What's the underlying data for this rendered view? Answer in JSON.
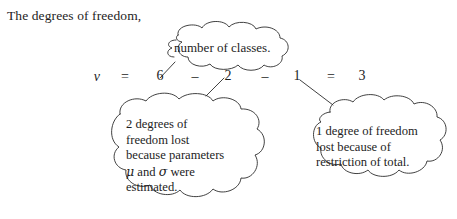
{
  "intro": {
    "text": "The degrees of freedom,"
  },
  "equation": {
    "nu_symbol": "ν",
    "equals_1": "=",
    "total_classes": "6",
    "minus_1": "–",
    "parameters_lost": "2",
    "minus_2": "–",
    "total_restriction_lost": "1",
    "equals_2": "=",
    "result": "3"
  },
  "callouts": {
    "top": {
      "label": "number of classes."
    },
    "left": {
      "line1": "2 degrees of",
      "line2": "freedom lost",
      "line3": "because parameters",
      "line4_pre": "μ",
      "line4_mid": " and ",
      "line4_greek2": "σ",
      "line4_post": " were",
      "line5": "estimated."
    },
    "right": {
      "line1": "1 degree of freedom",
      "line2": "lost because of",
      "line3": "restriction of total."
    }
  },
  "style": {
    "ink_color": "#1d1d1d",
    "outline_color": "#2b2b2b",
    "background": "#ffffff"
  }
}
